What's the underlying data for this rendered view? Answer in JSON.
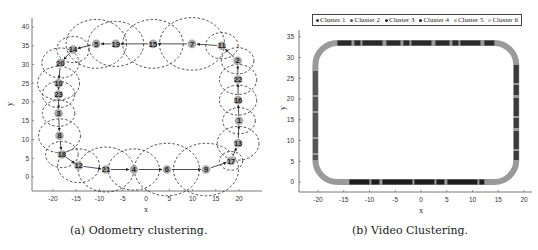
{
  "figure": {
    "subfigures": [
      {
        "id": "a",
        "caption": "(a) Odometry clustering.",
        "xlabel": "x",
        "ylabel": "y",
        "xticks": [
          "-20",
          "-15",
          "-10",
          "-5",
          "0",
          "5",
          "10",
          "15",
          "20"
        ],
        "yticks": [
          "0",
          "5",
          "10",
          "15",
          "20",
          "25",
          "30",
          "35",
          "40"
        ]
      },
      {
        "id": "b",
        "caption": "(b) Video Clustering.",
        "xlabel": "x",
        "ylabel": "y",
        "xticks": [
          "-20",
          "-15",
          "-10",
          "-5",
          "0",
          "5",
          "10",
          "15",
          "20"
        ],
        "yticks": [
          "0",
          "5",
          "10",
          "15",
          "20",
          "25",
          "30",
          "35"
        ],
        "legend": [
          {
            "label": "Cluster 1",
            "color": "#3a3a3a"
          },
          {
            "label": "Cluster 2",
            "color": "#555555"
          },
          {
            "label": "Cluster 3",
            "color": "#2a2a2a"
          },
          {
            "label": "Cluster 4",
            "color": "#1e1e1e"
          },
          {
            "label": "Cluster 5",
            "color": "#aaaaaa"
          },
          {
            "label": "Cluster 6",
            "color": "#bdbdbd"
          }
        ]
      }
    ]
  },
  "chart_data": [
    {
      "type": "scatter",
      "title": "",
      "caption": "(a) Odometry clustering.",
      "xlabel": "x",
      "ylabel": "y",
      "xlim": [
        -24,
        24
      ],
      "ylim": [
        -3,
        42
      ],
      "grid": false,
      "nodes": [
        {
          "id": "1",
          "x": 20,
          "y": 15,
          "r": 3.5
        },
        {
          "id": "2",
          "x": 19.7,
          "y": 31,
          "r": 3.5
        },
        {
          "id": "3",
          "x": -18.8,
          "y": 17,
          "r": 3.5
        },
        {
          "id": "4",
          "x": -2.6,
          "y": 2,
          "r": 5.5
        },
        {
          "id": "5",
          "x": -10.7,
          "y": 35.5,
          "r": 6.5
        },
        {
          "id": "6",
          "x": 4.5,
          "y": 2,
          "r": 7
        },
        {
          "id": "7",
          "x": 9.9,
          "y": 35.5,
          "r": 7
        },
        {
          "id": "8",
          "x": -18.6,
          "y": 11,
          "r": 4.5
        },
        {
          "id": "9",
          "x": 12.9,
          "y": 2,
          "r": 7
        },
        {
          "id": "10",
          "x": -18.8,
          "y": 25,
          "r": 4.5
        },
        {
          "id": "11",
          "x": 16.3,
          "y": 35,
          "r": 3.5
        },
        {
          "id": "12",
          "x": -14.5,
          "y": 3,
          "r": 4.5
        },
        {
          "id": "13",
          "x": 19.8,
          "y": 9,
          "r": 4.5
        },
        {
          "id": "14",
          "x": -15.7,
          "y": 34,
          "r": 3.5
        },
        {
          "id": "15",
          "x": 1.5,
          "y": 35.5,
          "r": 6.5
        },
        {
          "id": "16",
          "x": 19.8,
          "y": 20.5,
          "r": 4
        },
        {
          "id": "17",
          "x": 18.3,
          "y": 4.3,
          "r": 2.5
        },
        {
          "id": "18",
          "x": -18.1,
          "y": 6,
          "r": 3.5
        },
        {
          "id": "19",
          "x": -6.5,
          "y": 35.5,
          "r": 6
        },
        {
          "id": "20",
          "x": -18.4,
          "y": 30.4,
          "r": 4
        },
        {
          "id": "21",
          "x": -8.6,
          "y": 2,
          "r": 6
        },
        {
          "id": "22",
          "x": 19.8,
          "y": 26,
          "r": 4
        },
        {
          "id": "23",
          "x": -18.8,
          "y": 22,
          "r": 3.5
        }
      ],
      "edges": [
        [
          "19",
          "5"
        ],
        [
          "5",
          "14"
        ],
        [
          "15",
          "19"
        ],
        [
          "7",
          "15"
        ],
        [
          "11",
          "7"
        ],
        [
          "2",
          "11"
        ],
        [
          "22",
          "2"
        ],
        [
          "16",
          "22"
        ],
        [
          "1",
          "16"
        ],
        [
          "13",
          "1"
        ],
        [
          "17",
          "13"
        ],
        [
          "9",
          "17"
        ],
        [
          "6",
          "9"
        ],
        [
          "4",
          "6"
        ],
        [
          "21",
          "4"
        ],
        [
          "12",
          "21"
        ],
        [
          "18",
          "12"
        ],
        [
          "8",
          "18"
        ],
        [
          "3",
          "8"
        ],
        [
          "23",
          "3"
        ],
        [
          "10",
          "23"
        ],
        [
          "20",
          "10"
        ],
        [
          "14",
          "20"
        ]
      ]
    },
    {
      "type": "scatter",
      "title": "",
      "caption": "(b) Video Clustering.",
      "xlabel": "x",
      "ylabel": "y",
      "xlim": [
        -23,
        21
      ],
      "ylim": [
        -2.5,
        36
      ],
      "grid": false,
      "legend": [
        "Cluster 1",
        "Cluster 2",
        "Cluster 3",
        "Cluster 4",
        "Cluster 5",
        "Cluster 6"
      ],
      "legend_position": "top",
      "trajectory": "rounded rectangle loop from x=-20.5 to x=18.5, y=0 to y=33.5",
      "corner_points": [
        [
          -20.5,
          0
        ],
        [
          18.5,
          0
        ],
        [
          18.5,
          33.5
        ],
        [
          -20.5,
          33.5
        ]
      ]
    }
  ]
}
